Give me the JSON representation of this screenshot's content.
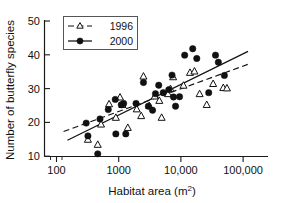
{
  "chart_data": {
    "type": "scatter",
    "title": "",
    "xlabel": "Habitat area (m2)",
    "xlabel_base": "Habitat area (m",
    "xlabel_sup": "2",
    "xlabel_tail": ")",
    "ylabel": "Number of butterfly species",
    "xscale": "log",
    "yscale": "linear",
    "xlim": [
      100,
      150000
    ],
    "ylim": [
      9,
      52
    ],
    "grid": false,
    "legend_position": "top-left",
    "xticks": [
      {
        "value": 100,
        "label": "100"
      },
      {
        "value": 1000,
        "label": "1000"
      },
      {
        "value": 10000,
        "label": "10,000"
      },
      {
        "value": 100000,
        "label": "100,000"
      }
    ],
    "yticks": [
      {
        "value": 10,
        "label": "10"
      },
      {
        "value": 20,
        "label": "20"
      },
      {
        "value": 30,
        "label": "30"
      },
      {
        "value": 40,
        "label": "40"
      },
      {
        "value": 50,
        "label": "50"
      }
    ],
    "series": [
      {
        "name": "1996",
        "marker": "open-triangle",
        "line": "dashed",
        "color": "#111111",
        "points": [
          [
            320,
            15.0
          ],
          [
            460,
            13.5
          ],
          [
            520,
            19.5
          ],
          [
            700,
            25.5
          ],
          [
            900,
            21.5
          ],
          [
            1050,
            27.5
          ],
          [
            1150,
            25.3
          ],
          [
            1400,
            18.5
          ],
          [
            1950,
            24.0
          ],
          [
            2300,
            22.0
          ],
          [
            2500,
            33.7
          ],
          [
            3100,
            25.0
          ],
          [
            3800,
            27.8
          ],
          [
            4500,
            26.5
          ],
          [
            4900,
            21.5
          ],
          [
            6200,
            28.5
          ],
          [
            6800,
            30.0
          ],
          [
            7500,
            33.5
          ],
          [
            11000,
            31.0
          ],
          [
            14000,
            34.8
          ],
          [
            16500,
            35.2
          ],
          [
            20000,
            28.5
          ],
          [
            26000,
            25.3
          ],
          [
            33000,
            31.5
          ],
          [
            48000,
            30.3
          ],
          [
            55000,
            30.2
          ]
        ],
        "fit_line": {
          "x1": 130,
          "y1": 17.3,
          "x2": 120000,
          "y2": 37.2
        }
      },
      {
        "name": "2000",
        "marker": "filled-circle",
        "line": "solid",
        "color": "#111111",
        "points": [
          [
            300,
            19.8
          ],
          [
            320,
            16.0
          ],
          [
            460,
            10.7
          ],
          [
            500,
            21.0
          ],
          [
            680,
            23.8
          ],
          [
            880,
            26.8
          ],
          [
            900,
            16.6
          ],
          [
            1100,
            25.2
          ],
          [
            1200,
            25.6
          ],
          [
            1300,
            16.6
          ],
          [
            1900,
            25.6
          ],
          [
            2500,
            31.8
          ],
          [
            3000,
            24.8
          ],
          [
            3500,
            23.6
          ],
          [
            3900,
            28.5
          ],
          [
            4400,
            31.0
          ],
          [
            5200,
            28.8
          ],
          [
            6400,
            29.7
          ],
          [
            7200,
            34.0
          ],
          [
            7600,
            27.5
          ],
          [
            8200,
            24.8
          ],
          [
            9500,
            27.6
          ],
          [
            11500,
            39.9
          ],
          [
            15500,
            41.8
          ],
          [
            18000,
            38.9
          ],
          [
            28000,
            28.8
          ],
          [
            36000,
            39.9
          ],
          [
            40000,
            37.8
          ],
          [
            50000,
            33.9
          ]
        ],
        "fit_line": {
          "x1": 150,
          "y1": 14.7,
          "x2": 120000,
          "y2": 41.0
        }
      }
    ]
  },
  "legend": {
    "entries": [
      {
        "label": "1996",
        "marker": "open-triangle",
        "line": "dashed"
      },
      {
        "label": "2000",
        "marker": "filled-circle",
        "line": "solid"
      }
    ]
  }
}
